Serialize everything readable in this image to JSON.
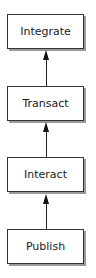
{
  "diagram": {
    "type": "vertical-flow",
    "direction": "bottom-to-top",
    "nodes": [
      {
        "id": "integrate",
        "label": "Integrate"
      },
      {
        "id": "transact",
        "label": "Transact"
      },
      {
        "id": "interact",
        "label": "Interact"
      },
      {
        "id": "publish",
        "label": "Publish"
      }
    ],
    "edges": [
      {
        "from": "publish",
        "to": "interact"
      },
      {
        "from": "interact",
        "to": "transact"
      },
      {
        "from": "transact",
        "to": "integrate"
      }
    ]
  }
}
